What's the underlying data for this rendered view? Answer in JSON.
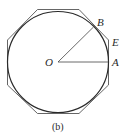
{
  "figure": {
    "caption": "(b)",
    "labels": {
      "center": "O",
      "point_a": "A",
      "point_b": "B",
      "point_e": "E"
    },
    "colors": {
      "stroke": "#3a3a3a",
      "background": "#ffffff"
    }
  }
}
